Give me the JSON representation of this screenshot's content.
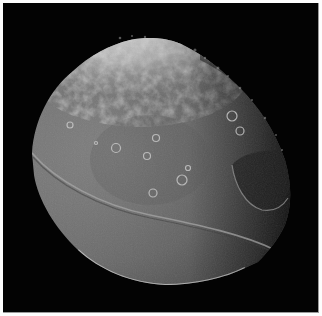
{
  "image": {
    "subject": "Iapetus (moon) photographed against black space",
    "background_color": "#030303",
    "border_color": "#fdfdfd",
    "palette": {
      "surface_mid": "#7a7a7a",
      "surface_dark": "#4a4a4a",
      "polar_bright": "#e6e6e6",
      "terminator_shadow": "#1a1a1a",
      "limb_highlight": "#d8d8d8"
    },
    "features": [
      {
        "name": "bright-polar-region",
        "position": "top"
      },
      {
        "name": "equatorial-ridge",
        "position": "left-limb to lower-right"
      },
      {
        "name": "large-impact-basin",
        "position": "right-center"
      },
      {
        "name": "terminator",
        "position": "right edge"
      },
      {
        "name": "craters",
        "count_visible": 10
      }
    ]
  }
}
